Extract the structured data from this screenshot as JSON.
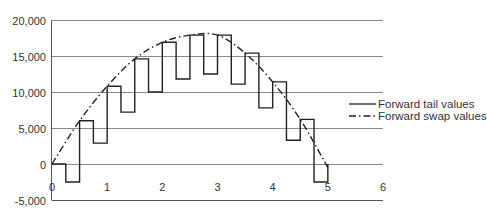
{
  "chart_data": {
    "type": "line",
    "title": "",
    "xlabel": "",
    "ylabel": "",
    "xlim": [
      0,
      6
    ],
    "ylim": [
      -5000,
      20000
    ],
    "x_ticks": [
      "0",
      "1",
      "2",
      "3",
      "4",
      "5",
      "6"
    ],
    "y_ticks": [
      "20,000",
      "15,000",
      "10,000",
      "5,000",
      "0",
      "-5,000"
    ],
    "y_tick_values": [
      20000,
      15000,
      10000,
      5000,
      0,
      -5000
    ],
    "grid": "horizontal",
    "legend_position": "right",
    "series": [
      {
        "name": "Forward tail values",
        "style": "solid step",
        "step_width": 0.25,
        "x": [
          0,
          0.25,
          0.5,
          0.75,
          1.0,
          1.25,
          1.5,
          1.75,
          2.0,
          2.25,
          2.5,
          2.75,
          3.0,
          3.25,
          3.5,
          3.75,
          4.0,
          4.25,
          4.5,
          4.75
        ],
        "values": [
          0,
          -2500,
          6000,
          2900,
          10800,
          7200,
          14600,
          10000,
          16900,
          11800,
          17900,
          12500,
          17900,
          11100,
          15400,
          7800,
          11400,
          3300,
          6200,
          -2500
        ]
      },
      {
        "name": "Forward swap values",
        "style": "dash-dot",
        "x": [
          0,
          0.5,
          1.0,
          1.5,
          2.0,
          2.5,
          3.0,
          3.5,
          4.0,
          4.5,
          5.0
        ],
        "values": [
          0,
          6000,
          10800,
          14600,
          16900,
          17900,
          17900,
          15400,
          11400,
          6200,
          -500
        ]
      }
    ]
  },
  "legend": {
    "items": [
      {
        "label": "Forward tail values"
      },
      {
        "label": "Forward swap values"
      }
    ]
  }
}
